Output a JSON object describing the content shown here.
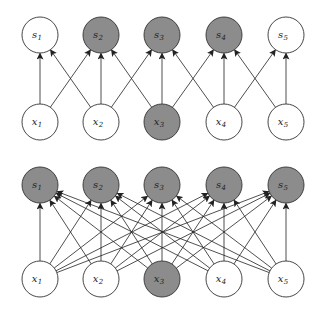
{
  "colors": {
    "stroke": "#333333",
    "shaded_fill": "#8c8c8c",
    "unshaded_fill": "#ffffff",
    "edge": "#222222"
  },
  "layout": {
    "xs": [
      40,
      101,
      162,
      224,
      286
    ],
    "radius": 18
  },
  "panels": [
    {
      "name": "sparse-connectivity-panel",
      "s_row_y": 35,
      "x_row_y": 122,
      "s_nodes": [
        {
          "base": "s",
          "sub": "1",
          "shaded": false
        },
        {
          "base": "s",
          "sub": "2",
          "shaded": true
        },
        {
          "base": "s",
          "sub": "3",
          "shaded": true
        },
        {
          "base": "s",
          "sub": "4",
          "shaded": true
        },
        {
          "base": "s",
          "sub": "5",
          "shaded": false
        }
      ],
      "x_nodes": [
        {
          "base": "x",
          "sub": "1",
          "shaded": false
        },
        {
          "base": "x",
          "sub": "2",
          "shaded": false
        },
        {
          "base": "x",
          "sub": "3",
          "shaded": true
        },
        {
          "base": "x",
          "sub": "4",
          "shaded": false
        },
        {
          "base": "x",
          "sub": "5",
          "shaded": false
        }
      ],
      "connectivity": "kernel3"
    },
    {
      "name": "full-connectivity-panel",
      "s_row_y": 185,
      "x_row_y": 279,
      "s_nodes": [
        {
          "base": "s",
          "sub": "1",
          "shaded": true
        },
        {
          "base": "s",
          "sub": "2",
          "shaded": true
        },
        {
          "base": "s",
          "sub": "3",
          "shaded": true
        },
        {
          "base": "s",
          "sub": "4",
          "shaded": true
        },
        {
          "base": "s",
          "sub": "5",
          "shaded": true
        }
      ],
      "x_nodes": [
        {
          "base": "x",
          "sub": "1",
          "shaded": false
        },
        {
          "base": "x",
          "sub": "2",
          "shaded": false
        },
        {
          "base": "x",
          "sub": "3",
          "shaded": true
        },
        {
          "base": "x",
          "sub": "4",
          "shaded": false
        },
        {
          "base": "x",
          "sub": "5",
          "shaded": false
        }
      ],
      "connectivity": "full"
    }
  ]
}
